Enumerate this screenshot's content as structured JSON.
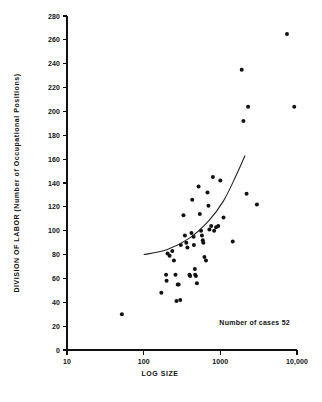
{
  "chart_data": {
    "type": "scatter",
    "title": "",
    "xlabel": "LOG SIZE",
    "ylabel": "DIVISION OF LABOR (Number of Occupational Positions)",
    "x_scale": "log",
    "y_scale": "linear",
    "xlim": [
      10,
      10000
    ],
    "ylim": [
      0,
      280
    ],
    "grid": false,
    "legend": false,
    "x_ticks": [
      10,
      100,
      1000,
      10000
    ],
    "x_tick_labels": [
      "10",
      "100",
      "1000",
      "10,000"
    ],
    "y_ticks": [
      0,
      20,
      40,
      60,
      80,
      100,
      120,
      140,
      160,
      180,
      200,
      220,
      240,
      260,
      280
    ],
    "y_tick_labels": [
      "0",
      "20",
      "40",
      "60",
      "80",
      "100",
      "120",
      "140",
      "160",
      "180",
      "200",
      "220",
      "240",
      "260",
      "280"
    ],
    "annotation": "Number of cases 52",
    "n_cases": 52,
    "point_color": "#111111",
    "curve_color": "#222222",
    "axis_color": "#111111",
    "background_color": "#ffffff",
    "points": [
      {
        "x": 52,
        "y": 30
      },
      {
        "x": 170,
        "y": 48
      },
      {
        "x": 196,
        "y": 63
      },
      {
        "x": 199,
        "y": 58
      },
      {
        "x": 205,
        "y": 81
      },
      {
        "x": 218,
        "y": 79
      },
      {
        "x": 236,
        "y": 83
      },
      {
        "x": 248,
        "y": 75
      },
      {
        "x": 260,
        "y": 63
      },
      {
        "x": 268,
        "y": 41
      },
      {
        "x": 278,
        "y": 55
      },
      {
        "x": 286,
        "y": 55
      },
      {
        "x": 300,
        "y": 42
      },
      {
        "x": 305,
        "y": 88
      },
      {
        "x": 330,
        "y": 113
      },
      {
        "x": 345,
        "y": 96
      },
      {
        "x": 360,
        "y": 90
      },
      {
        "x": 372,
        "y": 86
      },
      {
        "x": 395,
        "y": 63
      },
      {
        "x": 404,
        "y": 62
      },
      {
        "x": 420,
        "y": 98
      },
      {
        "x": 430,
        "y": 126
      },
      {
        "x": 448,
        "y": 95
      },
      {
        "x": 452,
        "y": 88
      },
      {
        "x": 465,
        "y": 68
      },
      {
        "x": 470,
        "y": 63
      },
      {
        "x": 480,
        "y": 62
      },
      {
        "x": 495,
        "y": 56
      },
      {
        "x": 520,
        "y": 137
      },
      {
        "x": 540,
        "y": 114
      },
      {
        "x": 560,
        "y": 100
      },
      {
        "x": 575,
        "y": 96
      },
      {
        "x": 590,
        "y": 92
      },
      {
        "x": 600,
        "y": 90
      },
      {
        "x": 620,
        "y": 78
      },
      {
        "x": 650,
        "y": 75
      },
      {
        "x": 680,
        "y": 132
      },
      {
        "x": 700,
        "y": 121
      },
      {
        "x": 720,
        "y": 101
      },
      {
        "x": 760,
        "y": 104
      },
      {
        "x": 800,
        "y": 145
      },
      {
        "x": 830,
        "y": 100
      },
      {
        "x": 880,
        "y": 103
      },
      {
        "x": 940,
        "y": 104
      },
      {
        "x": 1000,
        "y": 142
      },
      {
        "x": 1100,
        "y": 111
      },
      {
        "x": 1450,
        "y": 91
      },
      {
        "x": 1900,
        "y": 235
      },
      {
        "x": 2000,
        "y": 192
      },
      {
        "x": 2200,
        "y": 131
      },
      {
        "x": 2300,
        "y": 204
      },
      {
        "x": 3000,
        "y": 122
      },
      {
        "x": 7400,
        "y": 265
      },
      {
        "x": 9200,
        "y": 204
      }
    ],
    "fit_curve": [
      {
        "x": 100,
        "y": 80
      },
      {
        "x": 200,
        "y": 84
      },
      {
        "x": 400,
        "y": 94
      },
      {
        "x": 700,
        "y": 108
      },
      {
        "x": 1100,
        "y": 125
      },
      {
        "x": 1600,
        "y": 146
      },
      {
        "x": 2100,
        "y": 163
      }
    ]
  }
}
